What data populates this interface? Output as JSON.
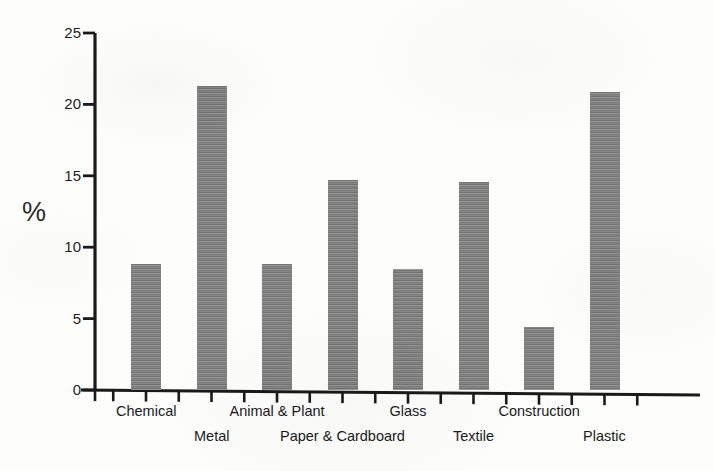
{
  "chart_data": {
    "type": "bar",
    "title": "",
    "subtitle": "",
    "xlabel": "",
    "ylabel": "%",
    "ylim": [
      0,
      25
    ],
    "y_ticks": [
      0,
      5,
      10,
      15,
      20,
      25
    ],
    "y_tick_labels": [
      "0",
      "5",
      "10",
      "15",
      "20",
      "25"
    ],
    "grid": false,
    "legend": null,
    "legend_position": "none",
    "bar_color": "#7e7e7e",
    "axis_color": "#1a1a1a",
    "categories": [
      "Chemical",
      "Metal",
      "Animal & Plant",
      "Paper & Cardboard",
      "Glass",
      "Textile",
      "Construction",
      "Plastic"
    ],
    "values": [
      8.8,
      21.3,
      8.8,
      14.7,
      8.5,
      14.6,
      4.4,
      20.9
    ],
    "label_rows": [
      0,
      1,
      0,
      1,
      0,
      1,
      0,
      1
    ],
    "annotations": []
  },
  "axis": {
    "y_title": "%"
  }
}
